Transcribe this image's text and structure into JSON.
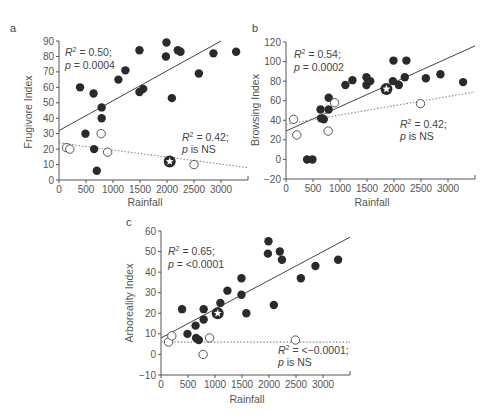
{
  "chart_data": [
    {
      "panel": "a",
      "type": "scatter",
      "title": "",
      "xlabel": "Rainfall",
      "ylabel": "Frugivore Index",
      "xlim": [
        0,
        3500
      ],
      "ylim": [
        0,
        90
      ],
      "xticks": [
        0,
        500,
        1000,
        1500,
        2000,
        2500,
        3000
      ],
      "yticks": [
        0,
        10,
        20,
        30,
        40,
        50,
        60,
        70,
        80,
        90
      ],
      "grid": false,
      "series": [
        {
          "name": "filled",
          "marker": "filled-circle",
          "x": [
            390,
            490,
            640,
            650,
            700,
            790,
            790,
            1100,
            1230,
            1490,
            1490,
            1560,
            1980,
            1990,
            2090,
            2200,
            2250,
            2590,
            2860,
            3280
          ],
          "y": [
            60,
            30,
            56,
            20,
            6,
            47,
            40,
            65,
            71,
            84,
            57,
            59,
            80,
            89,
            53,
            84,
            83,
            69,
            82,
            83
          ]
        },
        {
          "name": "open",
          "marker": "open-circle",
          "x": [
            140,
            200,
            780,
            900,
            2500
          ],
          "y": [
            21,
            20,
            30,
            18,
            10
          ]
        },
        {
          "name": "star",
          "marker": "star-circle",
          "x": [
            2050
          ],
          "y": [
            12
          ]
        }
      ],
      "fits": [
        {
          "style": "solid",
          "x": [
            0,
            3000
          ],
          "y": [
            32,
            90
          ],
          "annotation": {
            "line1": "R² = 0.50;",
            "line2": "p = 0.0004"
          }
        },
        {
          "style": "dotted",
          "x": [
            0,
            3500
          ],
          "y": [
            24,
            8
          ],
          "annotation": {
            "line1": "R² = 0.42;",
            "line2": "p is NS"
          }
        }
      ]
    },
    {
      "panel": "b",
      "type": "scatter",
      "xlabel": "Rainfall",
      "ylabel": "Browsing Index",
      "xlim": [
        0,
        3500
      ],
      "ylim": [
        -20,
        120
      ],
      "xticks": [
        0,
        500,
        1000,
        1500,
        2000,
        2500,
        3000
      ],
      "yticks": [
        -20,
        0,
        20,
        40,
        60,
        80,
        100,
        120
      ],
      "grid": false,
      "series": [
        {
          "name": "filled",
          "marker": "filled-circle",
          "x": [
            390,
            490,
            640,
            650,
            700,
            790,
            790,
            1100,
            1230,
            1490,
            1490,
            1560,
            1980,
            1990,
            2090,
            2200,
            2230,
            2590,
            2860,
            3280
          ],
          "y": [
            0,
            0,
            51,
            42,
            41,
            63,
            51,
            76,
            81,
            84,
            76,
            80,
            80,
            101,
            76,
            84,
            101,
            83,
            87,
            79
          ]
        },
        {
          "name": "open",
          "marker": "open-circle",
          "x": [
            140,
            200,
            780,
            900,
            2490
          ],
          "y": [
            41,
            25,
            29,
            58,
            57
          ]
        },
        {
          "name": "star",
          "marker": "star-circle",
          "x": [
            1860
          ],
          "y": [
            72
          ]
        }
      ],
      "fits": [
        {
          "style": "solid",
          "x": [
            0,
            3500
          ],
          "y": [
            29,
            116
          ],
          "annotation": {
            "line1": "R² = 0.54;",
            "line2": "p = 0.0002"
          }
        },
        {
          "style": "dotted",
          "x": [
            0,
            3500
          ],
          "y": [
            36,
            69
          ],
          "annotation": {
            "line1": "R² = 0.42;",
            "line2": "p is NS"
          }
        }
      ]
    },
    {
      "panel": "c",
      "type": "scatter",
      "xlabel": "Rainfall",
      "ylabel": "Arboreality Index",
      "xlim": [
        0,
        3500
      ],
      "ylim": [
        -10,
        60
      ],
      "xticks": [
        0,
        500,
        1000,
        1500,
        2000,
        2500,
        3000
      ],
      "yticks": [
        -10,
        0,
        10,
        20,
        30,
        40,
        50,
        60
      ],
      "grid": false,
      "series": [
        {
          "name": "filled",
          "marker": "filled-circle",
          "x": [
            390,
            490,
            640,
            650,
            700,
            790,
            790,
            1100,
            1230,
            1490,
            1490,
            1580,
            1980,
            1990,
            2090,
            2200,
            2240,
            2590,
            2860,
            3280
          ],
          "y": [
            22,
            10,
            14,
            8,
            7,
            22,
            17,
            25,
            31,
            37,
            29,
            20,
            49,
            55,
            24,
            50,
            46,
            37,
            43,
            46
          ]
        },
        {
          "name": "open",
          "marker": "open-circle",
          "x": [
            140,
            200,
            780,
            900,
            2490
          ],
          "y": [
            6,
            9,
            0,
            8,
            7
          ]
        },
        {
          "name": "star",
          "marker": "star-circle",
          "x": [
            1050
          ],
          "y": [
            20
          ]
        }
      ],
      "fits": [
        {
          "style": "solid",
          "x": [
            0,
            3500
          ],
          "y": [
            8,
            57
          ],
          "annotation": {
            "line1": "R² = 0.65;",
            "line2": "p = <0.0001"
          }
        },
        {
          "style": "dotted",
          "x": [
            0,
            3500
          ],
          "y": [
            6,
            6
          ],
          "annotation": {
            "line1": "R² = <−0.0001;",
            "line2": "p is NS"
          }
        }
      ]
    }
  ],
  "panels": {
    "a": {
      "letter": "a",
      "ylabel": "Frugivore Index",
      "xlabel": "Rainfall",
      "ann1a": "R",
      "ann1b": " = 0.50;",
      "ann1c": "p",
      "ann1d": " = 0.0004",
      "ann2a": "R",
      "ann2b": " = 0.42;",
      "ann2c": "p",
      "ann2d": " is NS"
    },
    "b": {
      "letter": "b",
      "ylabel": "Browsing Index",
      "xlabel": "Rainfall",
      "ann1a": "R",
      "ann1b": " = 0.54;",
      "ann1c": "p",
      "ann1d": " = 0.0002",
      "ann2a": "R",
      "ann2b": " = 0.42;",
      "ann2c": "p",
      "ann2d": " is NS"
    },
    "c": {
      "letter": "c",
      "ylabel": "Arboreality Index",
      "xlabel": "Rainfall",
      "ann1a": "R",
      "ann1b": " = 0.65;",
      "ann1c": "p",
      "ann1d": " = <0.0001",
      "ann2a": "R",
      "ann2b": " = <−0.0001;",
      "ann2c": "p",
      "ann2d": " is NS"
    }
  },
  "colors": {
    "filled": "#2a2a2a",
    "axis": "#555555",
    "solid_line": "#444444",
    "dotted_line": "#888888"
  }
}
